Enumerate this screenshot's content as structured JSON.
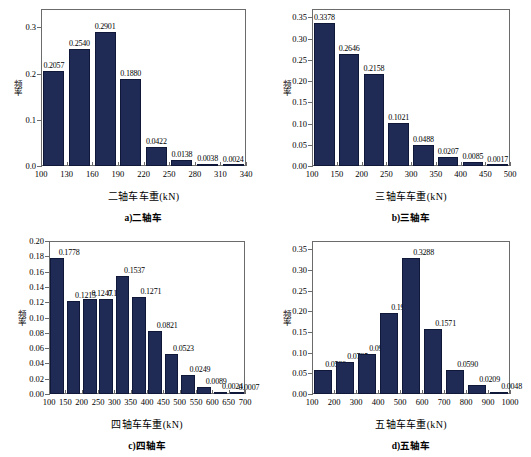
{
  "figure": {
    "ylabel_text": "频率",
    "panels": [
      "a",
      "b",
      "c",
      "d"
    ]
  },
  "chart_data": [
    {
      "id": "a",
      "type": "bar",
      "title": "",
      "caption": "a)二轴车",
      "xlabel": "二轴车车重(kN)",
      "ylabel": "频率",
      "categories": [
        "100-130",
        "130-160",
        "160-190",
        "190-220",
        "220-250",
        "250-280",
        "280-310",
        "310-340"
      ],
      "values": [
        0.2057,
        0.254,
        0.2901,
        0.188,
        0.0422,
        0.0138,
        0.0038,
        0.0024
      ],
      "labels": [
        "0.2057",
        "0.2540",
        "0.2901",
        "0.1880",
        "0.0422",
        "0.0138",
        "0.0038",
        "0.0024"
      ],
      "xticks": [
        "100",
        "130",
        "160",
        "190",
        "220",
        "250",
        "280",
        "310",
        "340"
      ],
      "xlim": [
        100,
        340
      ],
      "ylim": [
        0,
        0.34
      ],
      "yticks": [
        0,
        0.1,
        0.2,
        0.3
      ],
      "yticklabels": [
        "0.0",
        "0.1",
        "0.2",
        "0.3"
      ],
      "grid": false,
      "legend": "none"
    },
    {
      "id": "b",
      "type": "bar",
      "title": "",
      "caption": "b)三轴车",
      "xlabel": "三轴车车重(kN)",
      "ylabel": "频率",
      "categories": [
        "100-150",
        "150-200",
        "200-250",
        "250-300",
        "300-350",
        "350-400",
        "400-450",
        "450-500"
      ],
      "values": [
        0.3378,
        0.2646,
        0.2158,
        0.1021,
        0.0488,
        0.0207,
        0.0085,
        0.0017
      ],
      "labels": [
        "0.3378",
        "0.2646",
        "0.2158",
        "0.1021",
        "0.0488",
        "0.0207",
        "0.0085",
        "0.0017"
      ],
      "xticks": [
        "100",
        "150",
        "200",
        "250",
        "300",
        "350",
        "400",
        "450",
        "500"
      ],
      "xlim": [
        100,
        500
      ],
      "ylim": [
        0,
        0.37
      ],
      "yticks": [
        0,
        0.05,
        0.1,
        0.15,
        0.2,
        0.25,
        0.3,
        0.35
      ],
      "yticklabels": [
        "0.00",
        "0.05",
        "0.10",
        "0.15",
        "0.20",
        "0.25",
        "0.30",
        "0.35"
      ],
      "grid": false,
      "legend": "none"
    },
    {
      "id": "c",
      "type": "bar",
      "title": "",
      "caption": "c)四轴车",
      "xlabel": "四轴车车重(kN)",
      "ylabel": "频率",
      "categories": [
        "100-150",
        "150-200",
        "200-250",
        "250-300",
        "300-350",
        "350-400",
        "400-450",
        "450-500",
        "500-550",
        "550-600",
        "600-650",
        "650-700"
      ],
      "values": [
        0.1778,
        0.1215,
        0.1247,
        0.1239,
        0.1537,
        0.1271,
        0.0821,
        0.0523,
        0.0249,
        0.0089,
        0.0024,
        0.0007
      ],
      "labels": [
        "0.1778",
        "0.1215",
        "0.1247",
        "0.1239",
        "0.1537",
        "0.1271",
        "0.0821",
        "0.0523",
        "0.0249",
        "0.0089",
        "0.0024",
        "0.0007"
      ],
      "xticks": [
        "100",
        "150",
        "200",
        "250",
        "300",
        "350",
        "400",
        "450",
        "500",
        "550",
        "600",
        "650",
        "700"
      ],
      "xlim": [
        100,
        700
      ],
      "ylim": [
        0,
        0.2
      ],
      "yticks": [
        0,
        0.02,
        0.04,
        0.06,
        0.08,
        0.1,
        0.12,
        0.14,
        0.16,
        0.18,
        0.2
      ],
      "yticklabels": [
        "0.00",
        "0.02",
        "0.04",
        "0.06",
        "0.08",
        "0.10",
        "0.12",
        "0.14",
        "0.16",
        "0.18",
        "0.20"
      ],
      "grid": false,
      "legend": "none"
    },
    {
      "id": "d",
      "type": "bar",
      "title": "",
      "caption": "d)五轴车",
      "xlabel": "五轴车车重(kN)",
      "ylabel": "频率",
      "categories": [
        "100-200",
        "200-300",
        "300-400",
        "400-500",
        "500-600",
        "600-700",
        "700-800",
        "800-900",
        "900-1000"
      ],
      "values": [
        0.0589,
        0.0785,
        0.0957,
        0.1963,
        0.3288,
        0.1571,
        0.059,
        0.0209,
        0.0048
      ],
      "labels": [
        "0.0589",
        "0.0785",
        "0.0957",
        "0.1963",
        "0.3288",
        "0.1571",
        "0.0590",
        "0.0209",
        "0.0048"
      ],
      "xticks": [
        "100",
        "200",
        "300",
        "400",
        "500",
        "600",
        "700",
        "800",
        "900",
        "1000"
      ],
      "xlim": [
        100,
        1000
      ],
      "ylim": [
        0,
        0.37
      ],
      "yticks": [
        0,
        0.05,
        0.1,
        0.15,
        0.2,
        0.25,
        0.3,
        0.35
      ],
      "yticklabels": [
        "0.00",
        "0.05",
        "0.10",
        "0.15",
        "0.20",
        "0.25",
        "0.30",
        "0.35"
      ],
      "grid": false,
      "legend": "none"
    }
  ],
  "style": {
    "bar_color": "#1f2a55",
    "axis_color": "#6b6b6b",
    "background": "#ffffff",
    "text_color": "#000000"
  }
}
